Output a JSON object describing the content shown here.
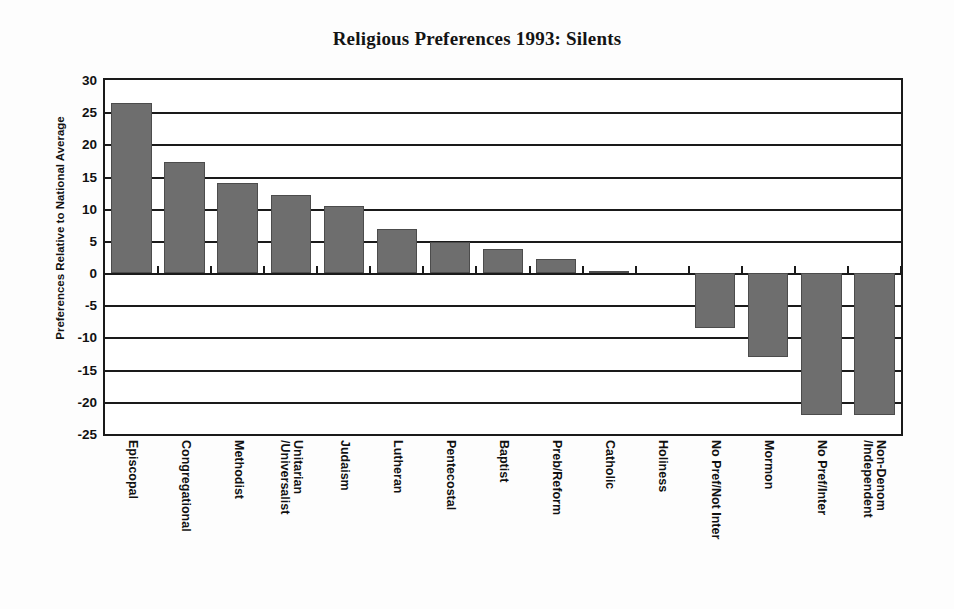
{
  "chart_data": {
    "type": "bar",
    "title": "Religious Preferences 1993: Silents",
    "xlabel": "",
    "ylabel": "Preferences Relative to National Average",
    "ylim": [
      -25,
      30
    ],
    "ytick_step": 5,
    "yticks": [
      30,
      25,
      20,
      15,
      10,
      5,
      0,
      -5,
      -10,
      -15,
      -20,
      -25
    ],
    "ytick_labels": [
      "30",
      "25",
      "20",
      "15",
      "10",
      "5",
      "0",
      "-5",
      "-10",
      "-15",
      "-20",
      "-25"
    ],
    "grid": true,
    "legend": null,
    "bar_color": "#6e6e6e",
    "bar_edge_color": "#4c4c4c",
    "axis_color": "#1a1a1a",
    "categories": [
      "Episcopal",
      "Congregational",
      "Methodist",
      "Unitarian /Universalist",
      "Judaism",
      "Lutheran",
      "Pentecostal",
      "Baptist",
      "Preb/Reform",
      "Catholic",
      "Holiness",
      "No Pref/Not Inter",
      "Mormon",
      "No Pref/Inter",
      "Non-Denom /Independent"
    ],
    "category_lines": [
      [
        "Episcopal"
      ],
      [
        "Congregational"
      ],
      [
        "Methodist"
      ],
      [
        "Unitarian",
        "/Universalist"
      ],
      [
        "Judaism"
      ],
      [
        "Lutheran"
      ],
      [
        "Pentecostal"
      ],
      [
        "Baptist"
      ],
      [
        "Preb/Reform"
      ],
      [
        "Catholic"
      ],
      [
        "Holiness"
      ],
      [
        "No Pref/Not Inter"
      ],
      [
        "Mormon"
      ],
      [
        "No Pref/Inter"
      ],
      [
        "Non-Denom",
        "/Independent"
      ]
    ],
    "values": [
      26.5,
      17.2,
      14.0,
      12.2,
      10.5,
      6.9,
      4.8,
      3.8,
      2.2,
      0.3,
      0.0,
      -8.5,
      -13.0,
      -22.0,
      -22.0
    ]
  }
}
